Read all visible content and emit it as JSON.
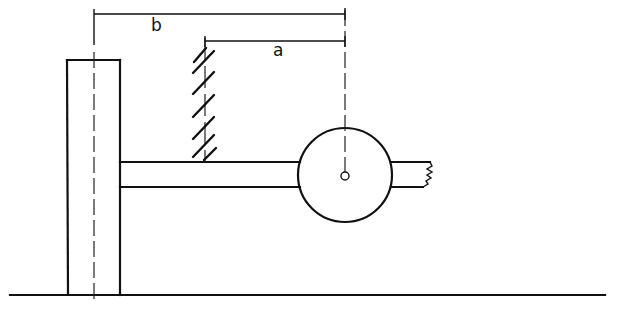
{
  "diagram": {
    "type": "mechanical-sketch",
    "labels": {
      "dimension_b": "b",
      "dimension_a": "a"
    },
    "components": [
      {
        "name": "vertical-column",
        "description": "Vertical post fixed to the ground with a dash-dot centerline"
      },
      {
        "name": "horizontal-beam",
        "description": "Horizontal arm extending from the column to a wheel/disc"
      },
      {
        "name": "wheel-disc",
        "description": "Circular disc with a small central pivot hole"
      },
      {
        "name": "broken-stub",
        "description": "Short beam stub on the right side with a broken-end symbol"
      },
      {
        "name": "hatched-support",
        "description": "Hatched wall/support line resting on the beam"
      },
      {
        "name": "ground-line",
        "description": "Horizontal ground line"
      }
    ],
    "dimensions": [
      {
        "label": "b",
        "from": "column centerline",
        "to": "disc center"
      },
      {
        "label": "a",
        "from": "hatched support",
        "to": "disc center"
      }
    ],
    "colors": {
      "stroke": "#111111",
      "background": "#ffffff"
    }
  }
}
